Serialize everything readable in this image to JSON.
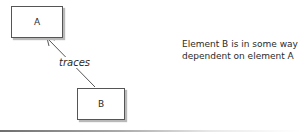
{
  "diagram": {
    "nodes": [
      {
        "id": "A",
        "label": "A"
      },
      {
        "id": "B",
        "label": "B"
      }
    ],
    "edges": [
      {
        "from": "B",
        "to": "A",
        "label": "traces",
        "style": "solid-open-arrow"
      }
    ],
    "description": "Element B is in some way dependent on element A",
    "colors": {
      "stroke": "#555555",
      "shadow": "#b9b9b9",
      "text": "#2a2a2a"
    }
  }
}
